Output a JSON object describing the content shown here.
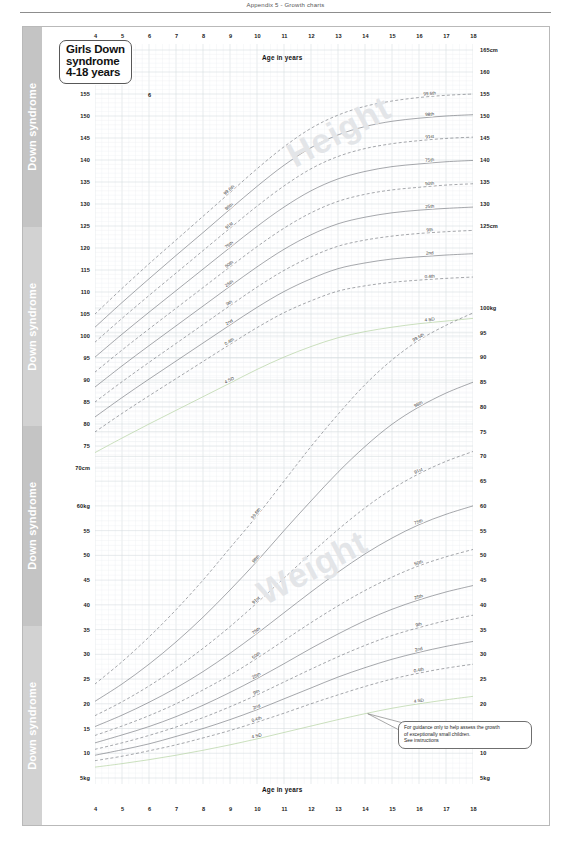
{
  "page": {
    "header_text": "Appendix 5 - Growth charts"
  },
  "spine": {
    "label": "Down syndrome",
    "repeat": 4
  },
  "title_box": {
    "line1": "Girls Down",
    "line2": "syndrome",
    "line3": "4-18 years"
  },
  "axes": {
    "age_title_top": "Age in years",
    "age_title_bottom": "Age in years",
    "age_ticks": [
      4,
      5,
      6,
      7,
      8,
      9,
      10,
      11,
      12,
      13,
      14,
      15,
      16,
      17,
      18
    ],
    "age_min": 4,
    "age_max": 18,
    "height_unit_top": "165cm",
    "height_unit_bottom": "70cm",
    "height_ticks_left": [
      "165cm",
      "160",
      "155",
      "150",
      "145",
      "140",
      "135",
      "130",
      "125",
      "120",
      "115",
      "110",
      "105",
      "100",
      "95",
      "90",
      "85",
      "80",
      "75",
      "70cm"
    ],
    "height_ticks_right": [
      "165cm",
      "160",
      "155",
      "150",
      "145",
      "140",
      "135",
      "130",
      "125cm"
    ],
    "weight_ticks_left": [
      "60kg",
      "55",
      "50",
      "45",
      "40",
      "35",
      "30",
      "25",
      "20",
      "15",
      "10",
      "5kg"
    ],
    "weight_ticks_right": [
      "100kg",
      "95",
      "90",
      "85",
      "80",
      "75",
      "70",
      "65",
      "60",
      "55",
      "50",
      "45",
      "40",
      "35",
      "30",
      "25",
      "20",
      "15",
      "10",
      "5kg"
    ]
  },
  "note": {
    "line1": "For guidance only to help assess the growth",
    "line2": "of exceptionally small children.",
    "line3": "See instructions"
  },
  "watermarks": {
    "height": "Height",
    "weight": "Weight"
  },
  "colors": {
    "curve": "#6f7278",
    "grid_minor": "#eef1f3",
    "grid_major": "#d7dde1",
    "spine": "#c9c9c9",
    "sd_line": "#b9d6a8",
    "frame": "#b9b9b9"
  },
  "chart_data": {
    "type": "line",
    "title": "Girls Down syndrome 4-18 years",
    "xlabel": "Age in years",
    "ylabel": "Height (cm) / Weight (kg)",
    "xlim": [
      4,
      18
    ],
    "grid": true,
    "legend": "inline curve labels",
    "x": [
      4,
      5,
      6,
      7,
      8,
      9,
      10,
      11,
      12,
      13,
      14,
      15,
      16,
      17,
      18
    ],
    "panels": [
      {
        "name": "height",
        "unit": "cm",
        "ylim": [
          70,
          165
        ],
        "ylabel": "Height cm",
        "series": [
          {
            "name": "99.6th",
            "dash": true,
            "values": [
              105.0,
              110.8,
              116.4,
              121.8,
              127.2,
              132.6,
              138.0,
              143.0,
              147.2,
              150.2,
              152.2,
              153.4,
              154.2,
              154.7,
              155.0
            ]
          },
          {
            "name": "98th",
            "dash": false,
            "values": [
              102.0,
              107.6,
              113.0,
              118.3,
              123.5,
              128.8,
              134.0,
              138.8,
              142.8,
              145.7,
              147.6,
              148.8,
              149.5,
              150.0,
              150.3
            ]
          },
          {
            "name": "91st",
            "dash": true,
            "values": [
              98.6,
              104.0,
              109.2,
              114.3,
              119.4,
              124.5,
              129.5,
              134.1,
              138.0,
              140.8,
              142.6,
              143.7,
              144.4,
              144.9,
              145.2
            ]
          },
          {
            "name": "75th",
            "dash": false,
            "values": [
              95.2,
              100.4,
              105.4,
              110.3,
              115.2,
              120.1,
              124.9,
              129.3,
              133.0,
              135.7,
              137.4,
              138.5,
              139.1,
              139.6,
              139.9
            ]
          },
          {
            "name": "50th",
            "dash": true,
            "values": [
              91.8,
              96.8,
              101.6,
              106.3,
              111.0,
              115.7,
              120.3,
              124.5,
              128.0,
              130.6,
              132.2,
              133.2,
              133.8,
              134.3,
              134.6
            ]
          },
          {
            "name": "25th",
            "dash": false,
            "values": [
              88.4,
              93.2,
              97.8,
              102.3,
              106.8,
              111.3,
              115.7,
              119.7,
              123.0,
              125.5,
              127.0,
              128.0,
              128.6,
              129.0,
              129.3
            ]
          },
          {
            "name": "9th",
            "dash": true,
            "values": [
              85.0,
              89.6,
              94.0,
              98.3,
              102.6,
              106.9,
              111.1,
              114.9,
              118.0,
              120.4,
              121.8,
              122.7,
              123.3,
              123.7,
              124.0
            ]
          },
          {
            "name": "2nd",
            "dash": false,
            "values": [
              81.6,
              86.0,
              90.2,
              94.3,
              98.4,
              102.5,
              106.5,
              110.1,
              113.0,
              115.3,
              116.6,
              117.5,
              118.0,
              118.4,
              118.7
            ]
          },
          {
            "name": "0.4th",
            "dash": true,
            "values": [
              78.2,
              82.4,
              86.4,
              90.3,
              94.2,
              98.1,
              101.9,
              105.3,
              108.0,
              110.2,
              111.4,
              112.2,
              112.7,
              113.1,
              113.4
            ]
          },
          {
            "name": "-4 SD",
            "dash": false,
            "sd": true,
            "values": [
              73.5,
              76.8,
              80.0,
              83.1,
              86.2,
              89.3,
              92.4,
              95.2,
              97.6,
              99.6,
              101.0,
              102.0,
              102.8,
              103.4,
              104.0
            ]
          }
        ]
      },
      {
        "name": "weight",
        "unit": "kg",
        "ylim": [
          5,
          100
        ],
        "ylabel": "Weight kg",
        "series": [
          {
            "name": "99.6th",
            "dash": true,
            "values": [
              24.0,
              28.5,
              33.5,
              39.0,
              45.0,
              51.5,
              58.0,
              65.0,
              72.0,
              78.5,
              84.5,
              89.5,
              93.5,
              96.5,
              99.0
            ]
          },
          {
            "name": "98th",
            "dash": false,
            "values": [
              20.5,
              24.0,
              28.0,
              32.5,
              37.5,
              43.0,
              48.8,
              55.0,
              61.0,
              66.8,
              72.0,
              76.5,
              80.0,
              82.8,
              85.0
            ]
          },
          {
            "name": "91st",
            "dash": true,
            "values": [
              17.6,
              20.4,
              23.6,
              27.2,
              31.2,
              35.6,
              40.4,
              45.4,
              50.4,
              55.2,
              59.6,
              63.4,
              66.5,
              69.0,
              71.0
            ]
          },
          {
            "name": "75th",
            "dash": false,
            "values": [
              15.4,
              17.7,
              20.3,
              23.2,
              26.5,
              30.2,
              34.2,
              38.4,
              42.6,
              46.6,
              50.3,
              53.5,
              56.2,
              58.3,
              60.0
            ]
          },
          {
            "name": "50th",
            "dash": true,
            "values": [
              13.6,
              15.5,
              17.6,
              20.0,
              22.8,
              25.8,
              29.2,
              32.8,
              36.4,
              39.8,
              42.9,
              45.6,
              47.9,
              49.7,
              51.2
            ]
          },
          {
            "name": "25th",
            "dash": false,
            "values": [
              12.1,
              13.7,
              15.4,
              17.4,
              19.7,
              22.3,
              25.1,
              28.1,
              31.2,
              34.1,
              36.8,
              39.1,
              41.0,
              42.6,
              43.9
            ]
          },
          {
            "name": "9th",
            "dash": true,
            "values": [
              10.8,
              12.1,
              13.6,
              15.3,
              17.2,
              19.4,
              21.8,
              24.4,
              27.0,
              29.5,
              31.8,
              33.8,
              35.4,
              36.8,
              37.9
            ]
          },
          {
            "name": "2nd",
            "dash": false,
            "values": [
              9.6,
              10.7,
              11.9,
              13.4,
              15.0,
              16.8,
              18.8,
              21.0,
              23.2,
              25.4,
              27.3,
              29.0,
              30.4,
              31.6,
              32.6
            ]
          },
          {
            "name": "0.4th",
            "dash": true,
            "values": [
              8.5,
              9.4,
              10.5,
              11.7,
              13.1,
              14.6,
              16.3,
              18.1,
              20.0,
              21.8,
              23.5,
              25.0,
              26.2,
              27.2,
              28.0
            ]
          },
          {
            "name": "-4 SD",
            "dash": false,
            "sd": true,
            "values": [
              7.2,
              7.9,
              8.7,
              9.6,
              10.6,
              11.7,
              12.9,
              14.2,
              15.5,
              16.8,
              18.0,
              19.1,
              20.0,
              20.8,
              21.5
            ]
          }
        ]
      }
    ]
  }
}
